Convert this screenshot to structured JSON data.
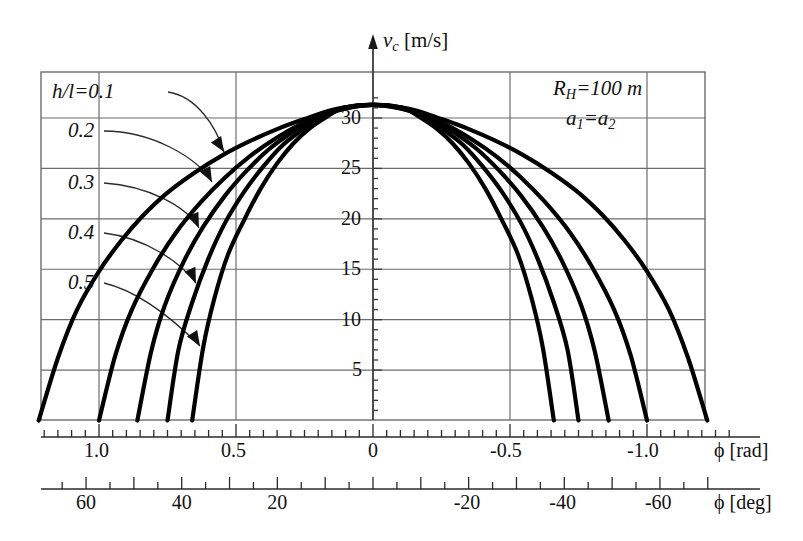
{
  "figure": {
    "y_axis_label": "v",
    "y_axis_label_sub": "c",
    "y_axis_units": "[m/s]",
    "x_axis_rad_symbol": "ϕ",
    "x_axis_rad_units": "[rad]",
    "x_axis_deg_symbol": "ϕ",
    "x_axis_deg_units": "[deg]"
  },
  "annotations": {
    "param1_name": "R",
    "param1_sub": "H",
    "param1_value": "=100 m",
    "param2_name": "a",
    "param2_sub": "1",
    "param2_eq": "=a",
    "param2_sub2": "2"
  },
  "legend": {
    "title_prefix": "h/l=",
    "items": [
      {
        "label": "0.1",
        "value": 0.1
      },
      {
        "label": "0.2",
        "value": 0.2
      },
      {
        "label": "0.3",
        "value": 0.3
      },
      {
        "label": "0.4",
        "value": 0.4
      },
      {
        "label": "0.5",
        "value": 0.5
      }
    ]
  },
  "y_ticks": [
    {
      "label": "5",
      "value": 5
    },
    {
      "label": "10",
      "value": 10
    },
    {
      "label": "15",
      "value": 15
    },
    {
      "label": "20",
      "value": 20
    },
    {
      "label": "25",
      "value": 25
    },
    {
      "label": "30",
      "value": 30
    }
  ],
  "x_ticks_rad": [
    {
      "label": "1.0",
      "value": 1.0
    },
    {
      "label": "0.5",
      "value": 0.5
    },
    {
      "label": "0",
      "value": 0.0
    },
    {
      "label": "-0.5",
      "value": -0.5
    },
    {
      "label": "-1.0",
      "value": -1.0
    }
  ],
  "x_ticks_deg": [
    {
      "label": "60",
      "value": 60
    },
    {
      "label": "40",
      "value": 40
    },
    {
      "label": "20",
      "value": 20
    },
    {
      "label": "-20",
      "value": -20
    },
    {
      "label": "-40",
      "value": -40
    },
    {
      "label": "-60",
      "value": -60
    }
  ],
  "chart_data": {
    "type": "line",
    "title": "",
    "xlabel": "ϕ [rad]",
    "ylabel": "v_c [m/s]",
    "xlim": [
      -1.22,
      1.22
    ],
    "ylim": [
      0,
      33
    ],
    "grid": true,
    "legend_position": "upper-left",
    "x_secondary_axis": {
      "label": "ϕ [deg]",
      "lim": [
        -70,
        70
      ]
    },
    "series": [
      {
        "name": "h/l=0.1",
        "x": [
          -1.22,
          -1.15,
          -1.08,
          -1.0,
          -0.92,
          -0.84,
          -0.75,
          -0.65,
          -0.55,
          -0.45,
          -0.35,
          -0.25,
          -0.15,
          -0.05,
          0.0,
          0.05,
          0.15,
          0.25,
          0.35,
          0.45,
          0.55,
          0.65,
          0.75,
          0.84,
          0.92,
          1.0,
          1.08,
          1.15,
          1.22
        ],
        "y": [
          0.0,
          6.2,
          11.0,
          14.8,
          17.8,
          20.3,
          22.6,
          24.6,
          26.3,
          27.7,
          28.9,
          29.9,
          30.8,
          31.25,
          31.3,
          31.25,
          30.8,
          29.9,
          28.9,
          27.7,
          26.3,
          24.6,
          22.6,
          20.3,
          17.8,
          14.8,
          11.0,
          6.2,
          0.0
        ]
      },
      {
        "name": "h/l=0.2",
        "x": [
          -1.0,
          -0.94,
          -0.88,
          -0.8,
          -0.72,
          -0.63,
          -0.54,
          -0.45,
          -0.36,
          -0.27,
          -0.18,
          -0.09,
          0.0,
          0.09,
          0.18,
          0.27,
          0.36,
          0.45,
          0.54,
          0.63,
          0.72,
          0.8,
          0.88,
          0.94,
          1.0
        ],
        "y": [
          0.0,
          6.5,
          11.0,
          15.2,
          18.6,
          21.6,
          24.1,
          26.2,
          27.9,
          29.3,
          30.3,
          31.0,
          31.3,
          31.0,
          30.3,
          29.3,
          27.9,
          26.2,
          24.1,
          21.6,
          18.6,
          15.2,
          11.0,
          6.5,
          0.0
        ]
      },
      {
        "name": "h/l=0.3",
        "x": [
          -0.86,
          -0.81,
          -0.76,
          -0.69,
          -0.62,
          -0.54,
          -0.46,
          -0.38,
          -0.3,
          -0.23,
          -0.15,
          -0.08,
          0.0,
          0.08,
          0.15,
          0.23,
          0.3,
          0.38,
          0.46,
          0.54,
          0.62,
          0.69,
          0.76,
          0.81,
          0.86
        ],
        "y": [
          0.0,
          6.8,
          11.4,
          15.8,
          19.2,
          22.3,
          24.8,
          26.9,
          28.5,
          29.7,
          30.6,
          31.1,
          31.3,
          31.1,
          30.6,
          29.7,
          28.5,
          26.9,
          24.8,
          22.3,
          19.2,
          15.8,
          11.4,
          6.8,
          0.0
        ]
      },
      {
        "name": "h/l=0.4",
        "x": [
          -0.75,
          -0.71,
          -0.66,
          -0.6,
          -0.54,
          -0.47,
          -0.4,
          -0.33,
          -0.26,
          -0.2,
          -0.13,
          -0.07,
          0.0,
          0.07,
          0.13,
          0.2,
          0.26,
          0.33,
          0.4,
          0.47,
          0.54,
          0.6,
          0.66,
          0.71,
          0.75
        ],
        "y": [
          0.0,
          7.0,
          11.7,
          16.1,
          19.6,
          22.7,
          25.2,
          27.3,
          28.8,
          30.0,
          30.8,
          31.2,
          31.3,
          31.2,
          30.8,
          30.0,
          28.8,
          27.3,
          25.2,
          22.7,
          19.6,
          16.1,
          11.7,
          7.0,
          0.0
        ]
      },
      {
        "name": "h/l=0.5",
        "x": [
          -0.66,
          -0.62,
          -0.58,
          -0.53,
          -0.47,
          -0.41,
          -0.35,
          -0.29,
          -0.23,
          -0.17,
          -0.12,
          -0.06,
          0.0,
          0.06,
          0.12,
          0.17,
          0.23,
          0.29,
          0.35,
          0.41,
          0.47,
          0.53,
          0.58,
          0.62,
          0.66
        ],
        "y": [
          0.0,
          7.2,
          12.0,
          16.4,
          19.9,
          23.0,
          25.5,
          27.5,
          29.0,
          30.1,
          30.9,
          31.2,
          31.3,
          31.2,
          30.9,
          30.1,
          29.0,
          27.5,
          25.5,
          23.0,
          19.9,
          16.4,
          12.0,
          7.2,
          0.0
        ]
      }
    ]
  }
}
